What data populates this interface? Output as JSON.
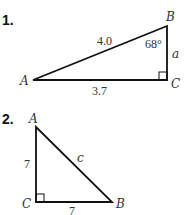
{
  "problems": [
    {
      "number": "1.",
      "vertices": {
        "A": "A",
        "B": "B",
        "C": "C"
      },
      "sides": {
        "hypotenuse_AB": "4.0",
        "AC": "3.7",
        "BC": "a"
      },
      "angle_B": "68°",
      "right_angle_at": "C"
    },
    {
      "number": "2.",
      "vertices": {
        "A": "A",
        "B": "B",
        "C": "C"
      },
      "sides": {
        "AC": "7",
        "CB": "7",
        "hypotenuse_AB": "c"
      },
      "right_angle_at": "C"
    }
  ]
}
